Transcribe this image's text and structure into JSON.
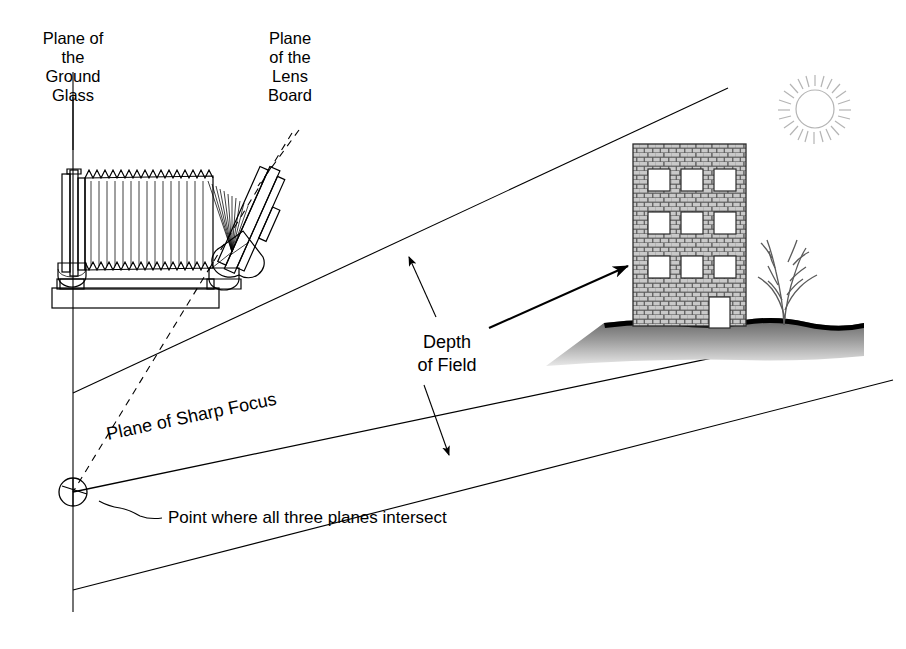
{
  "figure": {
    "background_color": "#ffffff",
    "line_color": "#000000",
    "sun_color": "#b4b4b4",
    "brick_color": "#595959",
    "ground_color": "#8c8c8c"
  },
  "labels": {
    "ground_glass": {
      "line1": "Plane of",
      "line2": "the",
      "line3": "Ground",
      "line4": "Glass"
    },
    "lens_board": {
      "line1": "Plane",
      "line2": "of the",
      "line3": "Lens",
      "line4": "Board"
    },
    "depth_of_field": {
      "line1": "Depth",
      "line2": "of Field"
    },
    "plane_of_sharp_focus": "Plane of Sharp Focus",
    "intersect_note": "Point where all three planes intersect"
  },
  "diagram_elements": {
    "planes": [
      {
        "name": "plane-of-the-ground-glass",
        "kind": "vertical-line",
        "x": 73,
        "y_top": 72,
        "y_bottom": 612
      },
      {
        "name": "plane-of-the-lens-board",
        "kind": "dashed-line",
        "x1": 290,
        "y1": 135,
        "x2": 73,
        "y2": 492
      },
      {
        "name": "depth-of-field-near-limit",
        "kind": "line",
        "x1": 73,
        "y1": 393,
        "x2": 728,
        "y2": 88
      },
      {
        "name": "plane-of-sharp-focus",
        "kind": "line",
        "x1": 73,
        "y1": 492,
        "x2": 827,
        "y2": 334
      },
      {
        "name": "depth-of-field-far-limit",
        "kind": "line",
        "x1": 73,
        "y1": 590,
        "x2": 893,
        "y2": 380
      }
    ],
    "intersection_point": {
      "cx": 73,
      "cy": 492,
      "r": 14
    },
    "sun": {
      "cx": 815,
      "cy": 109,
      "r": 19,
      "rays": 24
    },
    "building": {
      "x": 633,
      "y": 144,
      "width": 113,
      "height": 182,
      "window_rows": 3,
      "window_cols": 3,
      "door": true
    },
    "tree": {
      "x": 770,
      "y": 240
    },
    "camera": {
      "x": 55,
      "y": 168,
      "width": 190,
      "height": 140,
      "bellows_folds": 16
    }
  },
  "icons": {
    "sun": "sun-icon",
    "building": "building-icon",
    "tree": "tree-icon",
    "camera": "view-camera-icon",
    "arrow": "arrow-icon"
  }
}
